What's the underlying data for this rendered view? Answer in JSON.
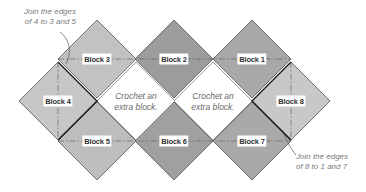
{
  "diagram": {
    "colors": {
      "outline": "#555555",
      "join_edge": "#1a1a1a",
      "dash_line": "#666666",
      "leader": "#555555"
    },
    "half_diagonal": 39,
    "blocks": [
      {
        "id": "1",
        "label": "Block 1",
        "cx": 252,
        "cy": 59,
        "fill": "#a8a8a8"
      },
      {
        "id": "2",
        "label": "Block 2",
        "cx": 174,
        "cy": 59,
        "fill": "#9c9c9c"
      },
      {
        "id": "3",
        "label": "Block 3",
        "cx": 97,
        "cy": 59,
        "fill": "#c2c2c2"
      },
      {
        "id": "4",
        "label": "Block 4",
        "cx": 58,
        "cy": 101,
        "fill": "#c6c6c6"
      },
      {
        "id": "5",
        "label": "Block 5",
        "cx": 97,
        "cy": 141,
        "fill": "#bdbdbd"
      },
      {
        "id": "6",
        "label": "Block 6",
        "cx": 174,
        "cy": 141,
        "fill": "#a0a0a0"
      },
      {
        "id": "7",
        "label": "Block 7",
        "cx": 252,
        "cy": 141,
        "fill": "#a9a9a9"
      },
      {
        "id": "8",
        "label": "Block 8",
        "cx": 291,
        "cy": 101,
        "fill": "#c8c8c8"
      }
    ],
    "extra_blocks": [
      {
        "text_line1": "Crochet an",
        "text_line2": "extra block.",
        "cx": 136,
        "cy": 101
      },
      {
        "text_line1": "Crochet an",
        "text_line2": "extra block.",
        "cx": 213,
        "cy": 101
      }
    ],
    "notes": {
      "top_left": {
        "line1": "Join the edges",
        "line2": "of 4 to 3 and 5"
      },
      "bottom_right": {
        "line1": "Join the edges",
        "line2": "of 8 to 1 and 7"
      }
    }
  }
}
